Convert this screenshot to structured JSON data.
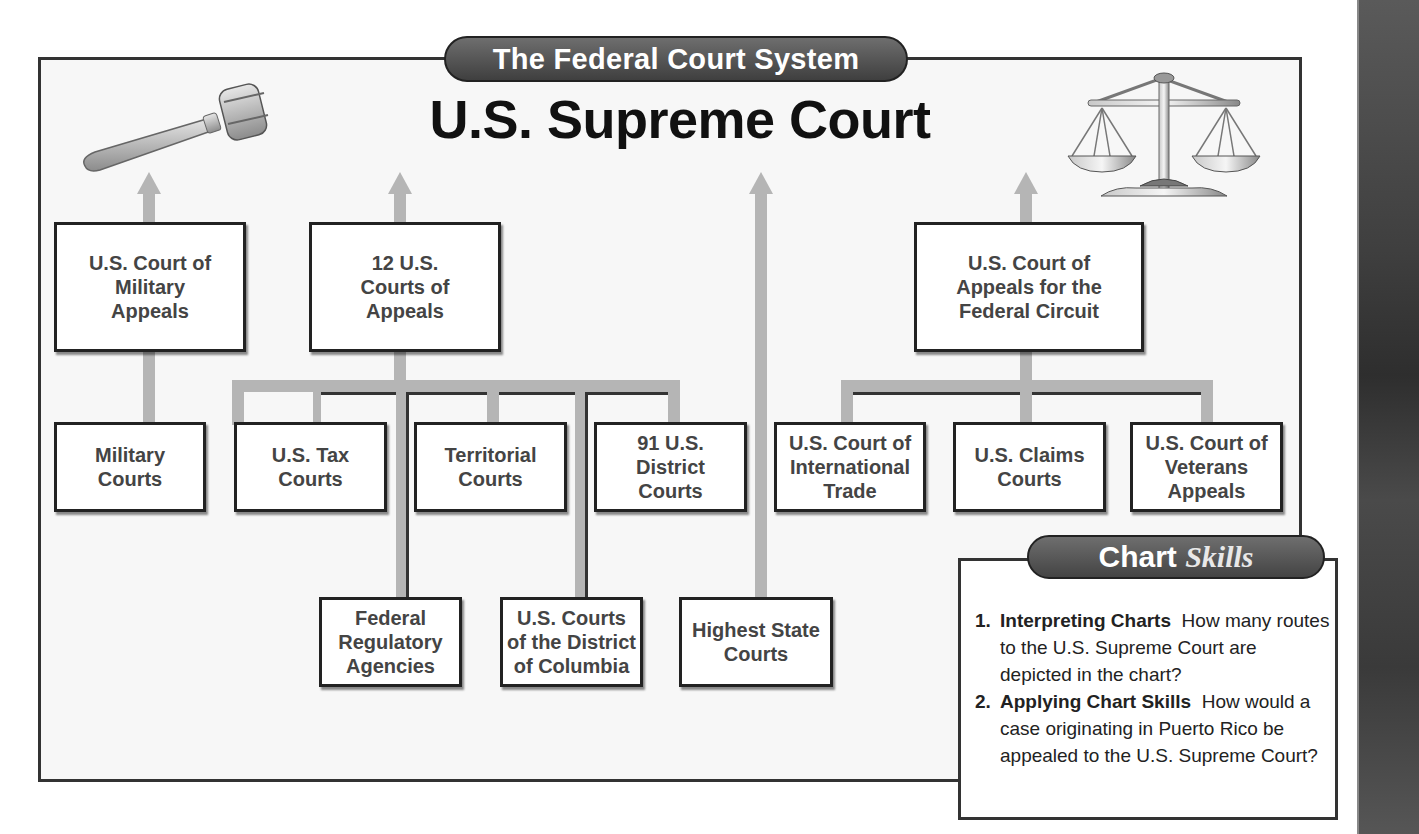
{
  "chart_title": "The Federal Court System",
  "top_court": "U.S. Supreme Court",
  "icons": {
    "left": "gavel-icon",
    "right": "scales-of-justice-icon"
  },
  "appellate_courts": [
    {
      "id": "military-appeals",
      "label": "U.S. Court of\nMilitary\nAppeals"
    },
    {
      "id": "courts-of-appeals",
      "label": "12 U.S.\nCourts of\nAppeals"
    },
    {
      "id": "federal-circuit",
      "label": "U.S. Court of\nAppeals for the\nFederal Circuit"
    }
  ],
  "trial_courts": [
    {
      "id": "military-courts",
      "label": "Military\nCourts",
      "appeals_to": "military-appeals"
    },
    {
      "id": "tax-courts",
      "label": "U.S. Tax\nCourts",
      "appeals_to": "courts-of-appeals"
    },
    {
      "id": "territorial-courts",
      "label": "Territorial\nCourts",
      "appeals_to": "courts-of-appeals"
    },
    {
      "id": "district-courts",
      "label": "91 U.S.\nDistrict\nCourts",
      "appeals_to": "courts-of-appeals"
    },
    {
      "id": "international-trade",
      "label": "U.S. Court of\nInternational\nTrade",
      "appeals_to": "federal-circuit"
    },
    {
      "id": "claims-courts",
      "label": "U.S. Claims\nCourts",
      "appeals_to": "federal-circuit"
    },
    {
      "id": "veterans-appeals",
      "label": "U.S. Court of\nVeterans\nAppeals",
      "appeals_to": "federal-circuit"
    }
  ],
  "lower_sources": [
    {
      "id": "regulatory-agencies",
      "label": "Federal\nRegulatory\nAgencies",
      "appeals_to": "courts-of-appeals"
    },
    {
      "id": "dc-courts",
      "label": "U.S. Courts\nof the District\nof Columbia",
      "appeals_to": "courts-of-appeals"
    },
    {
      "id": "state-courts",
      "label": "Highest State\nCourts",
      "appeals_to": "supreme-court"
    }
  ],
  "chart_skills": {
    "title_plain": "Chart",
    "title_italic": "Skills",
    "questions": [
      {
        "num": "1.",
        "label": "Interpreting Charts",
        "text": "How many routes to the U.S. Supreme Court are depicted in the chart?"
      },
      {
        "num": "2.",
        "label": "Applying Chart Skills",
        "text": "How would a case originating in Puerto Rico be appealed to the U.S. Supreme Court?"
      }
    ]
  }
}
